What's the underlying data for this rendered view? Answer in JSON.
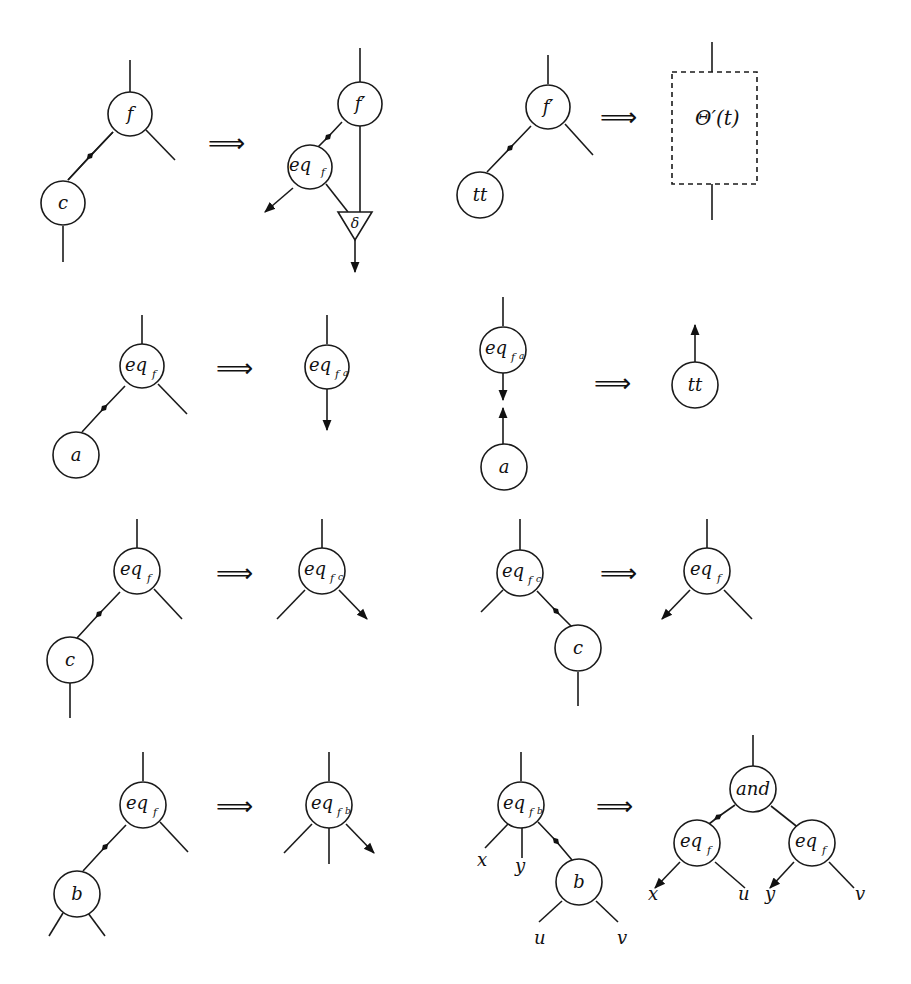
{
  "figure": {
    "rewrite_symbol": "⟹",
    "rules": [
      {
        "id": "r1",
        "lhs": {
          "nodes": [
            "f",
            "c"
          ]
        },
        "rhs": {
          "nodes": [
            "f′",
            "eq",
            "δ"
          ]
        }
      },
      {
        "id": "r2",
        "lhs": {
          "nodes": [
            "f′",
            "tt"
          ]
        },
        "rhs": {
          "box": "Θ′(t)"
        }
      },
      {
        "id": "r3",
        "lhs": {
          "nodes": [
            "eq_f",
            "a"
          ]
        },
        "rhs": {
          "nodes": [
            "eq_fa"
          ]
        }
      },
      {
        "id": "r4",
        "lhs": {
          "nodes": [
            "eq_fa",
            "a"
          ]
        },
        "rhs": {
          "nodes": [
            "tt"
          ]
        }
      },
      {
        "id": "r5",
        "lhs": {
          "nodes": [
            "eq_f",
            "c"
          ]
        },
        "rhs": {
          "nodes": [
            "eq_fc"
          ]
        }
      },
      {
        "id": "r6",
        "lhs": {
          "nodes": [
            "eq_fc",
            "c"
          ]
        },
        "rhs": {
          "nodes": [
            "eq_f"
          ]
        }
      },
      {
        "id": "r7",
        "lhs": {
          "nodes": [
            "eq_f",
            "b"
          ]
        },
        "rhs": {
          "nodes": [
            "eq_fb"
          ]
        }
      },
      {
        "id": "r8",
        "lhs": {
          "nodes": [
            "eq_fb",
            "b"
          ]
        },
        "rhs": {
          "nodes": [
            "and",
            "eq_f",
            "eq_f"
          ]
        }
      }
    ]
  },
  "labels": {
    "f": "f",
    "f_prime": "f′",
    "c": "c",
    "tt": "tt",
    "a": "a",
    "b": "b",
    "eq": "eq",
    "sub_f": "f",
    "delta": "δ",
    "theta": "Θ′(t)",
    "and": "and",
    "x": "x",
    "y": "y",
    "u": "u",
    "v": "v",
    "implies": "⟹"
  }
}
